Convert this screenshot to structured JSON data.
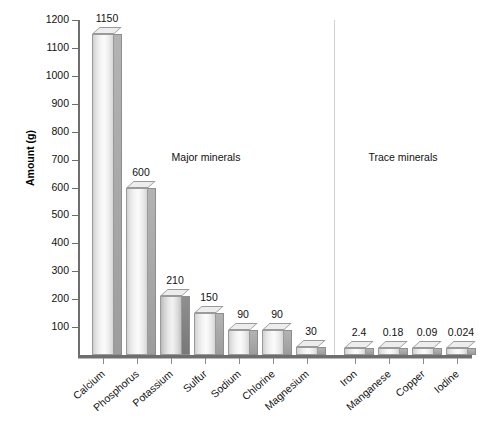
{
  "chart_data": {
    "type": "bar",
    "title": "",
    "xlabel": "",
    "ylabel": "Amount (g)",
    "ylim": [
      0,
      1200
    ],
    "ytick_values": [
      100,
      200,
      300,
      400,
      500,
      600,
      700,
      800,
      900,
      1000,
      1100,
      1200
    ],
    "ytick_labels": [
      "100",
      "200",
      "300",
      "400",
      "500",
      "600",
      "700",
      "800",
      "900",
      "1000",
      "1100",
      "1200"
    ],
    "grid": false,
    "legend": "none",
    "categories": [
      "Calcium",
      "Phosphorus",
      "Potassium",
      "Sulfur",
      "Sodium",
      "Chlorine",
      "Magnesium",
      "Iron",
      "Manganese",
      "Copper",
      "Iodine"
    ],
    "values": [
      1150,
      600,
      210,
      150,
      90,
      90,
      30,
      2.4,
      0.18,
      0.09,
      0.024
    ],
    "value_labels": [
      "1150",
      "600",
      "210",
      "150",
      "90",
      "90",
      "30",
      "2.4",
      "0.18",
      "0.09",
      "0.024"
    ],
    "annotations": [
      {
        "text": "Major minerals",
        "group": "left"
      },
      {
        "text": "Trace minerals",
        "group": "right"
      }
    ],
    "group_divider_after_category": "Magnesium",
    "colors": {
      "bar_front_light": "#f4f4f4",
      "bar_side_shadow": "#9d9d9d",
      "axis": "#6e6e6e",
      "divider": "#d2d2d2",
      "text": "#111111",
      "background": "#ffffff"
    }
  },
  "sections": {
    "major_label": "Major minerals",
    "trace_label": "Trace minerals"
  },
  "axis": {
    "y_title": "Amount (g)"
  }
}
